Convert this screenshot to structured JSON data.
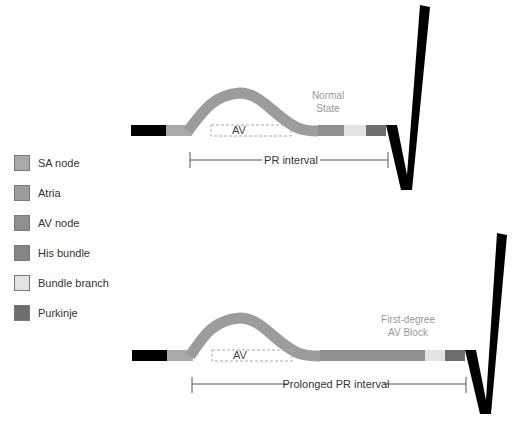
{
  "legend": {
    "items": [
      {
        "label": "SA node",
        "color": "#a9a9a9"
      },
      {
        "label": "Atria",
        "color": "#9c9c9c"
      },
      {
        "label": "AV node",
        "color": "#8f8f8f"
      },
      {
        "label": "His bundle",
        "color": "#858585"
      },
      {
        "label": "Bundle branch",
        "color": "#e3e3e3"
      },
      {
        "label": "Purkinje",
        "color": "#6e6e6e"
      }
    ]
  },
  "normal": {
    "state_line1": "Normal",
    "state_line2": "State",
    "av_label": "AV",
    "interval_label": "PR interval"
  },
  "block": {
    "state_line1": "First-degree",
    "state_line2": "AV Block",
    "av_label": "AV",
    "interval_label": "Prolonged PR interval"
  },
  "colors": {
    "black": "#000000",
    "sa": "#a9a9a9",
    "atria": "#9c9c9c",
    "av": "#8f8f8f",
    "his": "#858585",
    "bundle": "#e3e3e3",
    "purkinje": "#6e6e6e",
    "text_light": "#999999"
  }
}
